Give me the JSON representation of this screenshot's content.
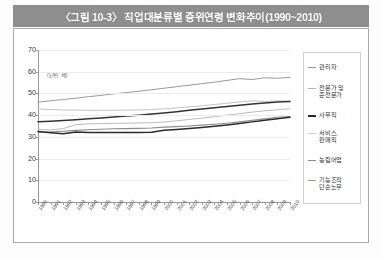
{
  "figure": {
    "title": "〈그림 10-3〉 직업대분류별 중위연령 변화추이(1990~2010)",
    "footer": ""
  },
  "chart_data": {
    "type": "line",
    "title": "〈그림 10-3〉 직업대분류별 중위연령 변화추이(1990~2010)",
    "unit_label": "(단위: 세)",
    "xlabel": "",
    "ylabel": "",
    "ylim": [
      0,
      70
    ],
    "yticks": [
      0,
      10,
      20,
      30,
      40,
      50,
      60,
      70
    ],
    "ytick_labels": [
      "0",
      "10",
      "20",
      "30",
      "40",
      "50",
      "60",
      "70"
    ],
    "grid": true,
    "legend_position": "right",
    "x": [
      1990,
      1991,
      1992,
      1993,
      1994,
      1995,
      1996,
      1997,
      1998,
      1999,
      2000,
      2001,
      2002,
      2003,
      2004,
      2005,
      2006,
      2007,
      2008,
      2009,
      2010
    ],
    "xtick_labels": [
      "1990",
      "1991",
      "1992",
      "1993",
      "1994",
      "1995",
      "1996",
      "1997",
      "1998",
      "1999",
      "2000",
      "2001",
      "2002",
      "2003",
      "2004",
      "2005",
      "2006",
      "2007",
      "2008",
      "2009",
      "2010"
    ],
    "series": [
      {
        "name": "관리자",
        "color": "#9b9b9b",
        "width": 1.0,
        "values": [
          46.0,
          46.6,
          47.2,
          47.8,
          48.5,
          49.1,
          49.8,
          50.4,
          51.0,
          51.7,
          52.4,
          53.1,
          53.8,
          54.5,
          55.2,
          56.0,
          56.8,
          56.4,
          57.2,
          57.0,
          57.4
        ]
      },
      {
        "name": "전문가 및\n준전문가",
        "color": "#c4c4c4",
        "width": 1.0,
        "values": [
          42.8,
          42.6,
          42.4,
          42.3,
          42.2,
          42.2,
          42.2,
          42.3,
          42.4,
          42.6,
          42.9,
          43.3,
          43.8,
          44.3,
          44.9,
          45.5,
          46.1,
          46.6,
          46.2,
          46.6,
          46.4
        ]
      },
      {
        "name": "사무직",
        "color": "#333333",
        "width": 1.5,
        "values": [
          37.0,
          37.2,
          37.5,
          37.9,
          38.3,
          38.7,
          39.1,
          39.6,
          40.0,
          40.5,
          41.0,
          41.6,
          42.2,
          42.8,
          43.4,
          44.0,
          44.6,
          45.1,
          45.6,
          46.0,
          46.3
        ]
      },
      {
        "name": "서비스,\n판매직",
        "color": "#bdbdbd",
        "width": 1.0,
        "values": [
          33.4,
          33.2,
          33.8,
          35.6,
          36.0,
          36.1,
          36.2,
          36.3,
          36.4,
          36.5,
          36.8,
          37.4,
          38.0,
          38.6,
          39.3,
          40.0,
          40.7,
          41.4,
          42.0,
          42.5,
          42.9
        ]
      },
      {
        "name": "농림어업",
        "color": "#8c8c8c",
        "width": 1.1,
        "values": [
          32.2,
          32.3,
          32.6,
          33.0,
          33.3,
          33.5,
          33.7,
          33.8,
          33.9,
          34.1,
          34.5,
          34.7,
          35.0,
          35.4,
          35.8,
          36.3,
          36.9,
          37.6,
          38.3,
          39.0,
          39.4
        ]
      },
      {
        "name": "기능조작\n단순노무",
        "color": "#2b2b2b",
        "width": 1.5,
        "values": [
          32.5,
          31.9,
          31.4,
          32.2,
          32.0,
          32.0,
          32.0,
          32.0,
          32.0,
          32.1,
          33.0,
          33.4,
          33.8,
          34.3,
          34.9,
          35.5,
          36.2,
          36.9,
          37.6,
          38.3,
          39.0
        ]
      }
    ]
  },
  "legend": {
    "items": [
      {
        "label": "관리자",
        "color": "#9b9b9b",
        "thickness": 1
      },
      {
        "label": "전문가 및\n준전문가",
        "color": "#b4b4b4",
        "thickness": 1
      },
      {
        "label": "사무직",
        "color": "#2b2b2b",
        "thickness": 2
      },
      {
        "label": "서비스,\n판매직",
        "color": "#cfcfcf",
        "thickness": 1
      },
      {
        "label": "농림어업",
        "color": "#8c8c8c",
        "thickness": 1
      },
      {
        "label": "기능조작\n단순노무",
        "color": "#9b9b9b",
        "thickness": 1
      }
    ]
  }
}
